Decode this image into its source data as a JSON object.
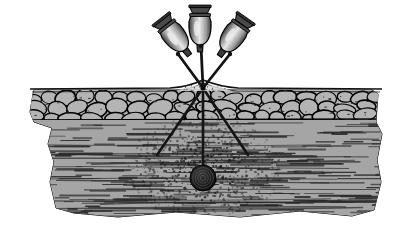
{
  "figure": {
    "background_color": "#ffffff",
    "width": 406,
    "height": 232
  },
  "palette": {
    "ink": "#1a1a1a",
    "outline": "#000000",
    "tissue_fill": "#a8a8a8",
    "fat_lobule_fill": "#b4b4b4",
    "muscle_fill": "#a5a5a5",
    "muscle_fiber": "#2a2a2a",
    "vial_body_light": "#e8e8e8",
    "vial_body_mid": "#9a9a9a",
    "vial_body_dark": "#3c3c3c",
    "vial_cap": "#4a4a4a",
    "needle": "#141414",
    "depot_dark": "#151515",
    "particle": "#1c1c1c",
    "skin_surface": "#111111"
  },
  "instruments": {
    "label": "syringe-ampoule-set",
    "count": 3,
    "items": [
      {
        "name": "left-ampoule",
        "rotation_deg": -38,
        "bulb_cx": 176,
        "bulb_cy": 38,
        "bulb_rx": 11,
        "bulb_ry": 15,
        "cap_label": "crimped-cap"
      },
      {
        "name": "center-ampoule",
        "rotation_deg": 0,
        "bulb_cx": 200,
        "bulb_cy": 30,
        "bulb_rx": 11,
        "bulb_ry": 15,
        "cap_label": "crimped-cap"
      },
      {
        "name": "right-ampoule",
        "rotation_deg": 35,
        "bulb_cx": 232,
        "bulb_cy": 38,
        "bulb_rx": 11,
        "bulb_ry": 15,
        "cap_label": "crimped-cap"
      }
    ]
  },
  "needles": {
    "label": "needle-set",
    "entry_point": {
      "x": 203,
      "y": 88
    },
    "above_skin": [
      {
        "name": "needle-shaft-left",
        "x1": 178,
        "y1": 54,
        "x2": 203,
        "y2": 88
      },
      {
        "name": "needle-shaft-center",
        "x1": 201,
        "y1": 46,
        "x2": 203,
        "y2": 88
      },
      {
        "name": "needle-shaft-right",
        "x1": 230,
        "y1": 54,
        "x2": 203,
        "y2": 88
      }
    ],
    "below_skin": [
      {
        "name": "needle-track-left",
        "x1": 203,
        "y1": 88,
        "x2": 157,
        "y2": 155
      },
      {
        "name": "needle-track-center",
        "x1": 203,
        "y1": 88,
        "x2": 203,
        "y2": 178
      },
      {
        "name": "needle-track-right",
        "x1": 203,
        "y1": 88,
        "x2": 248,
        "y2": 155
      }
    ]
  },
  "tissue": {
    "layers": [
      {
        "name": "skin-surface",
        "description": "epidermal surface line with tenting at needle entry",
        "top_y": 86
      },
      {
        "name": "subcutaneous-fat-layer",
        "description": "adipose lobules",
        "top_y": 90,
        "bottom_y": 120,
        "lobule_count": 58
      },
      {
        "name": "muscle-layer",
        "description": "horizontal striated muscle fibers",
        "top_y": 120,
        "bottom_y": 214,
        "fiber_count": 230
      }
    ]
  },
  "injection": {
    "depot": {
      "name": "drug-depot-bolus",
      "cx": 203,
      "cy": 178,
      "r": 13,
      "ring_count": 4
    },
    "dispersion": {
      "name": "dispersion-cloud",
      "cx": 203,
      "cy": 168,
      "rx": 78,
      "ry": 52,
      "particle_count": 760
    }
  }
}
